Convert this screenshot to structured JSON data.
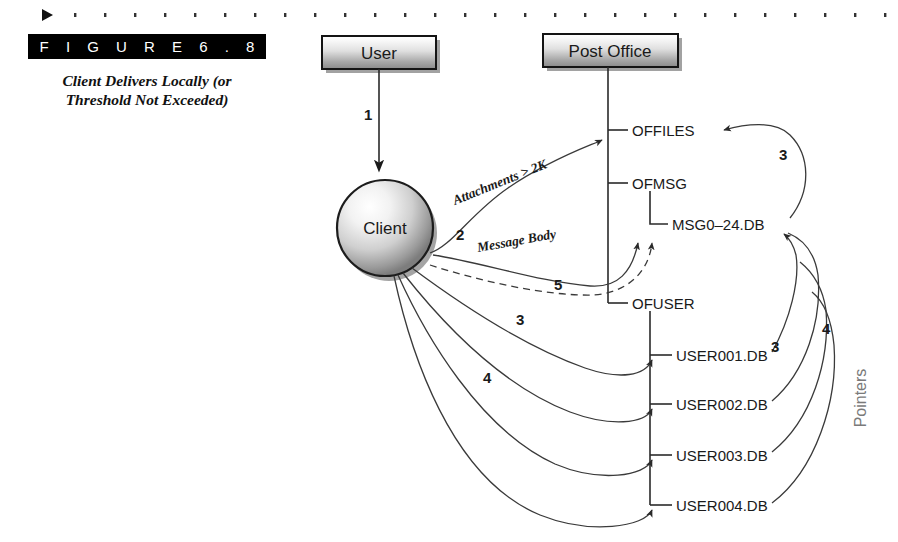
{
  "figure": {
    "banner_label": "F I G U R E   6 . 8",
    "caption": "Client Delivers Locally (or Threshold Not Exceeded)"
  },
  "top_rule": {
    "marker_icon": "triangle-right-icon",
    "dot_count": 28
  },
  "boxes": [
    {
      "id": "user",
      "label": "User",
      "x": 322,
      "y": 36,
      "w": 114,
      "h": 33
    },
    {
      "id": "post_office",
      "label": "Post Office",
      "x": 543,
      "y": 34,
      "w": 135,
      "h": 33
    }
  ],
  "sphere": {
    "id": "client",
    "label": "Client",
    "cx": 385,
    "cy": 228,
    "r": 48
  },
  "tree": {
    "trunk_x": 608,
    "nodes": [
      {
        "id": "offiles",
        "label": "OFFILES",
        "x": 632,
        "y": 130
      },
      {
        "id": "ofmsg",
        "label": "OFMSG",
        "x": 632,
        "y": 183
      },
      {
        "id": "msgdb",
        "label": "MSG0–24.DB",
        "x": 672,
        "y": 224
      },
      {
        "id": "ofuser",
        "label": "OFUSER",
        "x": 632,
        "y": 303
      },
      {
        "id": "user001",
        "label": "USER001.DB",
        "x": 676,
        "y": 355
      },
      {
        "id": "user002",
        "label": "USER002.DB",
        "x": 676,
        "y": 404
      },
      {
        "id": "user003",
        "label": "USER003.DB",
        "x": 676,
        "y": 455
      },
      {
        "id": "user004",
        "label": "USER004.DB",
        "x": 676,
        "y": 505
      }
    ]
  },
  "edge_labels": [
    {
      "id": "attachments",
      "text": "Attachments > 2K",
      "x": 455,
      "y": 205,
      "rotate": -22
    },
    {
      "id": "message_body",
      "text": "Message Body",
      "x": 478,
      "y": 252,
      "rotate": -10
    }
  ],
  "step_numbers": [
    {
      "id": "step-1",
      "text": "1",
      "x": 364,
      "y": 120
    },
    {
      "id": "step-2",
      "text": "2",
      "x": 456,
      "y": 240
    },
    {
      "id": "step-3-client",
      "text": "3",
      "x": 516,
      "y": 325
    },
    {
      "id": "step-4-client",
      "text": "4",
      "x": 483,
      "y": 383
    },
    {
      "id": "step-5",
      "text": "5",
      "x": 554,
      "y": 290
    },
    {
      "id": "step-3-offiles",
      "text": "3",
      "x": 779,
      "y": 160
    },
    {
      "id": "step-3-msgdb",
      "text": "3",
      "x": 771,
      "y": 352
    },
    {
      "id": "step-4-pointers",
      "text": "4",
      "x": 822,
      "y": 334
    }
  ],
  "annotations": [
    {
      "id": "pointers",
      "text": "Pointers",
      "x": 866,
      "y": 398,
      "rotate": -90
    }
  ],
  "colors": {
    "background": "#ffffff",
    "ink": "#1a1a1a",
    "line": "#2a2a2a",
    "curve": "#3a3a3a",
    "banner_bg": "#000000",
    "banner_text": "#ffffff",
    "pointers_gray": "#7a7a7a",
    "box_top": "#fdfdfd",
    "box_bottom": "#8e8e8e"
  }
}
